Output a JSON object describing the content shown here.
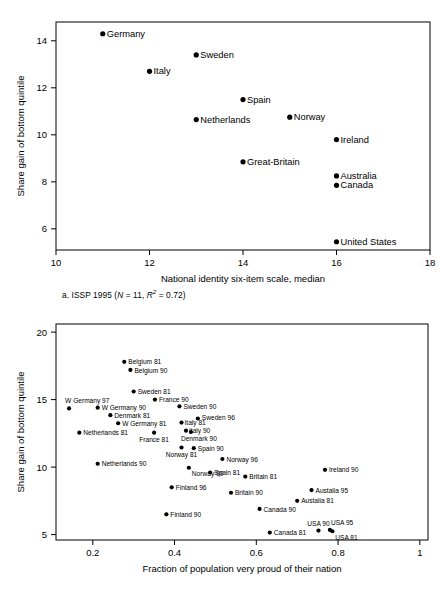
{
  "chart_data": [
    {
      "id": "a",
      "type": "scatter",
      "title": "",
      "caption_prefix": "a. ISSP 1995 (",
      "caption_n": "N",
      "caption_mid": " = 11, ",
      "caption_r": "R",
      "caption_sup": "2",
      "caption_suffix": " = 0.72)",
      "caption_plain": "a. ISSP 1995 (N = 11, R2 = 0.72)",
      "xlabel": "National identity six-item scale, median",
      "ylabel": "Share gain of bottom quintile",
      "xlim": [
        10,
        18
      ],
      "ylim": [
        5.1,
        14.8
      ],
      "xticks": [
        "10",
        "12",
        "14",
        "16",
        "18"
      ],
      "xtick_values": [
        10,
        12,
        14,
        16,
        18
      ],
      "yticks": [
        "6",
        "8",
        "10",
        "12",
        "14"
      ],
      "ytick_values": [
        6,
        8,
        10,
        12,
        14
      ],
      "grid": false,
      "legend": "none",
      "points": [
        {
          "label": "Germany",
          "x": 11.0,
          "y": 14.3,
          "anchor": "start"
        },
        {
          "label": "Sweden",
          "x": 13.0,
          "y": 13.4,
          "anchor": "start"
        },
        {
          "label": "Italy",
          "x": 12.0,
          "y": 12.7,
          "anchor": "start"
        },
        {
          "label": "Spain",
          "x": 14.0,
          "y": 11.5,
          "anchor": "start"
        },
        {
          "label": "Netherlands",
          "x": 13.0,
          "y": 10.65,
          "anchor": "start"
        },
        {
          "label": "Norway",
          "x": 15.0,
          "y": 10.75,
          "anchor": "start"
        },
        {
          "label": "Ireland",
          "x": 16.0,
          "y": 9.8,
          "anchor": "start"
        },
        {
          "label": "Great-Britain",
          "x": 14.0,
          "y": 8.85,
          "anchor": "start"
        },
        {
          "label": "Australia",
          "x": 16.0,
          "y": 8.25,
          "anchor": "start"
        },
        {
          "label": "Canada",
          "x": 16.0,
          "y": 7.85,
          "anchor": "start"
        },
        {
          "label": "United States",
          "x": 16.0,
          "y": 5.45,
          "anchor": "start"
        }
      ]
    },
    {
      "id": "b",
      "type": "scatter",
      "title": "",
      "caption_prefix": "b. World values survey (",
      "caption_n": "N",
      "caption_mid": " = 33, ",
      "caption_r": "R",
      "caption_sup": "2",
      "caption_suffix": " = 0.6)",
      "caption_plain": "b. World values survey (N = 33, R2 = 0.6)",
      "xlabel": "Fraction of population very proud of their nation",
      "ylabel": "Share gain of bottom quintile",
      "xlim": [
        0.11,
        1.02
      ],
      "ylim": [
        4.6,
        20.6
      ],
      "xticks": [
        "0.2",
        "0.4",
        "0.6",
        "0.8",
        "1"
      ],
      "xtick_values": [
        0.2,
        0.4,
        0.6,
        0.8,
        1.0
      ],
      "yticks": [
        "5",
        "10",
        "15",
        "20"
      ],
      "ytick_values": [
        5,
        10,
        15,
        20
      ],
      "grid": false,
      "legend": "none",
      "points": [
        {
          "label": "Belgium 81",
          "x": 0.277,
          "y": 17.8,
          "anchor": "start",
          "dx": 4,
          "dy": 2.6
        },
        {
          "label": "Belgium 90",
          "x": 0.292,
          "y": 17.2,
          "anchor": "start",
          "dx": 4,
          "dy": 2.6
        },
        {
          "label": "Sweden 81",
          "x": 0.3,
          "y": 15.6,
          "anchor": "start",
          "dx": 4,
          "dy": 2.6
        },
        {
          "label": "France 90",
          "x": 0.352,
          "y": 15.0,
          "anchor": "start",
          "dx": 4,
          "dy": 2.6
        },
        {
          "label": "W Germany 97",
          "x": 0.142,
          "y": 14.35,
          "anchor": "start",
          "dx": -4,
          "dy": -5.0
        },
        {
          "label": "W Germany 90",
          "x": 0.212,
          "y": 14.4,
          "anchor": "start",
          "dx": 4,
          "dy": 2.6
        },
        {
          "label": "Sweden 90",
          "x": 0.412,
          "y": 14.5,
          "anchor": "start",
          "dx": 4,
          "dy": 2.6
        },
        {
          "label": "Denmark 81",
          "x": 0.243,
          "y": 13.85,
          "anchor": "start",
          "dx": 4,
          "dy": 2.6
        },
        {
          "label": "Sweden 96",
          "x": 0.457,
          "y": 13.6,
          "anchor": "start",
          "dx": 4,
          "dy": 1.0
        },
        {
          "label": "W Germany 81",
          "x": 0.262,
          "y": 13.25,
          "anchor": "start",
          "dx": 4,
          "dy": 2.6
        },
        {
          "label": "Italy 81",
          "x": 0.417,
          "y": 13.3,
          "anchor": "start",
          "dx": 3,
          "dy": 2.6
        },
        {
          "label": "Italy 90",
          "x": 0.428,
          "y": 12.7,
          "anchor": "start",
          "dx": 3,
          "dy": 2.6
        },
        {
          "label": "Netherlands 81",
          "x": 0.167,
          "y": 12.55,
          "anchor": "start",
          "dx": 4,
          "dy": 2.6
        },
        {
          "label": "France 81",
          "x": 0.35,
          "y": 12.55,
          "anchor": "middle",
          "dx": 0,
          "dy": 9.0
        },
        {
          "label": "Denmark 90",
          "x": 0.44,
          "y": 12.6,
          "anchor": "middle",
          "dx": 8,
          "dy": 9.0
        },
        {
          "label": "Spain 90",
          "x": 0.447,
          "y": 11.4,
          "anchor": "start",
          "dx": 4,
          "dy": 2.6
        },
        {
          "label": "Norway 81",
          "x": 0.417,
          "y": 11.45,
          "anchor": "middle",
          "dx": 0,
          "dy": 9.5
        },
        {
          "label": "Norway 96",
          "x": 0.517,
          "y": 10.6,
          "anchor": "start",
          "dx": 4,
          "dy": 2.6
        },
        {
          "label": "Netherlands 90",
          "x": 0.212,
          "y": 10.25,
          "anchor": "start",
          "dx": 4,
          "dy": 2.6
        },
        {
          "label": "Norway 90",
          "x": 0.435,
          "y": 9.95,
          "anchor": "start",
          "dx": 3,
          "dy": 8.0
        },
        {
          "label": "Ireland 90",
          "x": 0.768,
          "y": 9.8,
          "anchor": "start",
          "dx": 4,
          "dy": 2.6
        },
        {
          "label": "Spain 81",
          "x": 0.487,
          "y": 9.6,
          "anchor": "start",
          "dx": 4,
          "dy": 2.6
        },
        {
          "label": "Britain 81",
          "x": 0.573,
          "y": 9.3,
          "anchor": "start",
          "dx": 4,
          "dy": 2.6
        },
        {
          "label": "Finland 96",
          "x": 0.393,
          "y": 8.5,
          "anchor": "start",
          "dx": 4,
          "dy": 2.6
        },
        {
          "label": "Austalia 95",
          "x": 0.735,
          "y": 8.3,
          "anchor": "start",
          "dx": 4,
          "dy": 2.6
        },
        {
          "label": "Britain 90",
          "x": 0.538,
          "y": 8.1,
          "anchor": "start",
          "dx": 4,
          "dy": 2.6
        },
        {
          "label": "Austalia 81",
          "x": 0.7,
          "y": 7.5,
          "anchor": "start",
          "dx": 4,
          "dy": 2.6
        },
        {
          "label": "Canada 90",
          "x": 0.608,
          "y": 6.9,
          "anchor": "start",
          "dx": 4,
          "dy": 2.6
        },
        {
          "label": "Finland 90",
          "x": 0.38,
          "y": 6.5,
          "anchor": "start",
          "dx": 4,
          "dy": 2.6
        },
        {
          "label": "USA 90",
          "x": 0.752,
          "y": 5.3,
          "anchor": "middle",
          "dx": 0,
          "dy": -4.5
        },
        {
          "label": "USA 95",
          "x": 0.78,
          "y": 5.35,
          "anchor": "start",
          "dx": 1,
          "dy": -4.5
        },
        {
          "label": "USA 81",
          "x": 0.786,
          "y": 5.25,
          "anchor": "start",
          "dx": 3,
          "dy": 8.5
        },
        {
          "label": "Canada 81",
          "x": 0.633,
          "y": 5.15,
          "anchor": "start",
          "dx": 4,
          "dy": 2.6
        }
      ]
    }
  ]
}
